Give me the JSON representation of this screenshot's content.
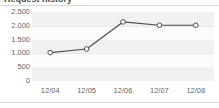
{
  "widget": {
    "title": "Request history",
    "background_color": "#ffffff"
  },
  "chart_data": {
    "type": "line",
    "title": "Request history",
    "xlabel": "",
    "ylabel": "",
    "categories": [
      "12/04",
      "12/05",
      "12/06",
      "12/07",
      "12/08"
    ],
    "values": [
      1030,
      1160,
      2140,
      2020,
      2020
    ],
    "series": [
      {
        "name": "Requests",
        "values": [
          1030,
          1160,
          2140,
          2020,
          2020
        ],
        "line_color": "#4d4d4d",
        "marker": "open-circle",
        "marker_fill": "#ffffff",
        "marker_stroke": "#4d4d4d"
      }
    ],
    "ylim": [
      0,
      2500
    ],
    "ytick_values": [
      0,
      500,
      1000,
      1500,
      2000,
      2500
    ],
    "ytick_labels": [
      "0",
      "500",
      "1.000",
      "1.500",
      "2.000",
      "2.500"
    ],
    "xtick_labels": [
      "12/04",
      "12/05",
      "12/06",
      "12/07",
      "12/08"
    ],
    "grid": true,
    "grid_style": "horizontal-banded",
    "legend": false,
    "legend_position": "none",
    "plot_background": "#fbfbfb",
    "band_color": "#f1f1f1",
    "gridline_color": "#e6e6e6"
  }
}
